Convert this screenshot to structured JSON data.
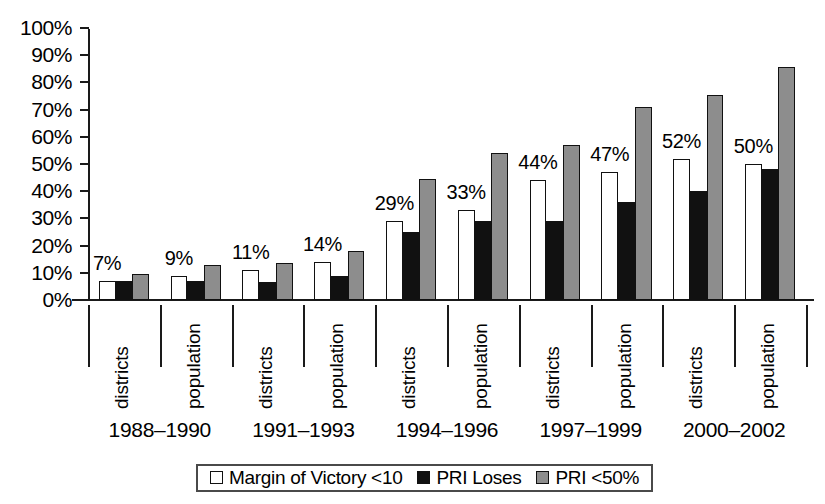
{
  "chart_data": {
    "type": "bar",
    "title": "",
    "subtitle": "",
    "xlabel": "",
    "ylabel": "",
    "ylim": [
      0,
      100
    ],
    "y_ticks": [
      "0%",
      "10%",
      "20%",
      "30%",
      "40%",
      "50%",
      "60%",
      "70%",
      "80%",
      "90%",
      "100%"
    ],
    "grid": false,
    "legend_position": "bottom",
    "categories": [
      "districts",
      "population",
      "districts",
      "population",
      "districts",
      "population",
      "districts",
      "population",
      "districts",
      "population"
    ],
    "periods": [
      "1988–1990",
      "1991–1993",
      "1994–1996",
      "1997–1999",
      "2000–2002"
    ],
    "series": [
      {
        "name": "Margin of Victory <10",
        "color": "#ffffff",
        "values": [
          7,
          9,
          11,
          14,
          29,
          33,
          44,
          47,
          52,
          50
        ],
        "labels": [
          "7%",
          "9%",
          "11%",
          "14%",
          "29%",
          "33%",
          "44%",
          "47%",
          "52%",
          "50%"
        ]
      },
      {
        "name": "PRI Loses",
        "color": "#111111",
        "values": [
          7,
          7,
          6.5,
          9,
          25,
          29,
          29,
          36,
          40,
          48
        ],
        "labels": [
          "",
          "",
          "",
          "",
          "",
          "",
          "",
          "",
          "",
          ""
        ]
      },
      {
        "name": "PRI <50%",
        "color": "#8d8d8d",
        "values": [
          9.5,
          13,
          13.5,
          18,
          44.5,
          54,
          57,
          71,
          75.5,
          85.5
        ],
        "labels": [
          "",
          "",
          "",
          "",
          "",
          "",
          "",
          "",
          "",
          ""
        ]
      }
    ]
  },
  "legend": {
    "items": [
      {
        "label": "Margin of Victory <10",
        "swatch": "white-square-icon"
      },
      {
        "label": "PRI Loses",
        "swatch": "black-square-icon"
      },
      {
        "label": "PRI <50%",
        "swatch": "gray-square-icon"
      }
    ]
  }
}
